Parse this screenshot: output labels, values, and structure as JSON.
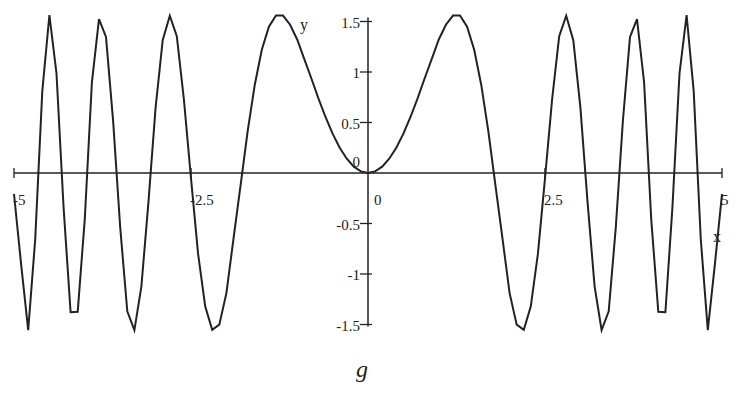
{
  "chart_data": {
    "type": "line",
    "title": "",
    "caption": "g",
    "xlabel": "x",
    "ylabel": "y",
    "xlim": [
      -5,
      5
    ],
    "ylim": [
      -1.5,
      1.5
    ],
    "grid": false,
    "legend": null,
    "x_ticks": [
      {
        "value": -5,
        "label": "-5"
      },
      {
        "value": -2.5,
        "label": "-2.5"
      },
      {
        "value": 0,
        "label": "0"
      },
      {
        "value": 2.5,
        "label": "2.5"
      },
      {
        "value": 5,
        "label": "5"
      }
    ],
    "y_ticks": [
      {
        "value": -1.5,
        "label": "-1.5"
      },
      {
        "value": -1,
        "label": "-1"
      },
      {
        "value": -0.5,
        "label": "-0.5"
      },
      {
        "value": 0,
        "label": "0"
      },
      {
        "value": 0.5,
        "label": "0.5"
      },
      {
        "value": 1,
        "label": "1"
      },
      {
        "value": 1.5,
        "label": "1.5"
      }
    ],
    "series": [
      {
        "name": "g",
        "color": "#222222",
        "x_half": [
          0,
          0.1,
          0.2,
          0.3,
          0.4,
          0.5,
          0.6,
          0.7,
          0.8,
          0.9,
          1.0,
          1.1,
          1.2,
          1.3,
          1.4,
          1.5,
          1.6,
          1.7,
          1.8,
          1.9,
          2.0,
          2.1,
          2.2,
          2.3,
          2.4,
          2.5,
          2.6,
          2.7,
          2.8,
          2.9,
          3.0,
          3.1,
          3.2,
          3.3,
          3.4,
          3.5,
          3.6,
          3.7,
          3.8,
          3.9,
          4.0,
          4.1,
          4.2,
          4.3,
          4.4,
          4.5,
          4.6,
          4.7,
          4.8,
          4.9,
          5.0
        ],
        "y_half": [
          0,
          0.0157,
          0.0628,
          0.1412,
          0.2507,
          0.3896,
          0.5546,
          0.7397,
          0.9354,
          1.1279,
          1.3218,
          1.4682,
          1.5589,
          1.5605,
          1.449,
          1.2201,
          0.869,
          0.4097,
          -0.1197,
          -0.6507,
          -1.1888,
          -1.5012,
          -1.5528,
          -1.3211,
          -0.8011,
          -0.0521,
          0.7279,
          1.3543,
          1.5571,
          1.3146,
          0.6474,
          -0.2798,
          -1.1214,
          -1.5569,
          -1.3689,
          -0.538,
          0.5181,
          1.3476,
          1.5231,
          0.898,
          -0.4532,
          -1.3745,
          -1.3788,
          -0.344,
          0.9856,
          1.5628,
          0.8108,
          -0.658,
          -1.5567,
          -0.9022,
          -0.2079
        ],
        "symmetry": "even"
      }
    ]
  }
}
